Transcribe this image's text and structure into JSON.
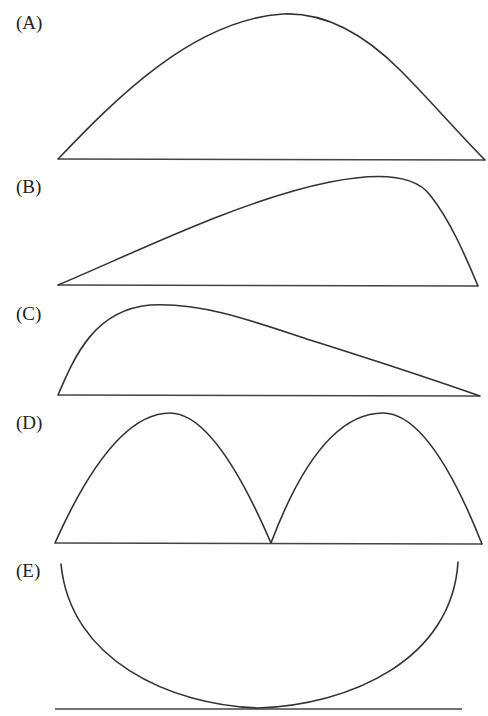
{
  "panels": [
    {
      "label": "(A)",
      "shape": "symmetric-hump",
      "label_top": 14
    },
    {
      "label": "(B)",
      "shape": "right-skewed-peak",
      "label_top": 178
    },
    {
      "label": "(C)",
      "shape": "left-skewed-peak",
      "label_top": 305
    },
    {
      "label": "(D)",
      "shape": "double-hump",
      "label_top": 414
    },
    {
      "label": "(E)",
      "shape": "u-shaped-bowl",
      "label_top": 562
    }
  ],
  "colors": {
    "stroke": "#333333",
    "background": "#ffffff"
  }
}
